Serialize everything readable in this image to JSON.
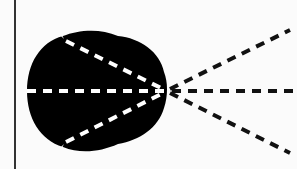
{
  "diagram": {
    "background": "#fbfbfb",
    "ink": "#111111",
    "border_line": {
      "x": 15,
      "y1": 0,
      "y2": 169,
      "color": "#333333",
      "width": 2
    },
    "blob": {
      "description": "black rounded bulb shape",
      "fill": "#000000",
      "bounds": {
        "left": 27,
        "top": 32,
        "right": 168,
        "bottom": 152
      }
    },
    "focal_point": {
      "x": 167,
      "y": 91
    },
    "inner_rays": [
      {
        "name": "upper-inner-ray",
        "from": [
          63,
          38
        ],
        "to": [
          167,
          91
        ],
        "color": "#ffffff"
      },
      {
        "name": "middle-inner-ray",
        "from": [
          27,
          91
        ],
        "to": [
          167,
          91
        ],
        "color": "#ffffff"
      },
      {
        "name": "lower-inner-ray",
        "from": [
          63,
          145
        ],
        "to": [
          167,
          91
        ],
        "color": "#ffffff"
      }
    ],
    "outer_rays": [
      {
        "name": "upper-outer-ray",
        "from": [
          167,
          91
        ],
        "to": [
          290,
          30
        ],
        "color": "#111111"
      },
      {
        "name": "middle-outer-ray",
        "from": [
          167,
          91
        ],
        "to": [
          297,
          91
        ],
        "color": "#111111"
      },
      {
        "name": "lower-outer-ray",
        "from": [
          167,
          91
        ],
        "to": [
          290,
          153
        ],
        "color": "#111111"
      }
    ],
    "dash": {
      "length": 9,
      "gap": 7,
      "stroke_width": 4
    }
  }
}
